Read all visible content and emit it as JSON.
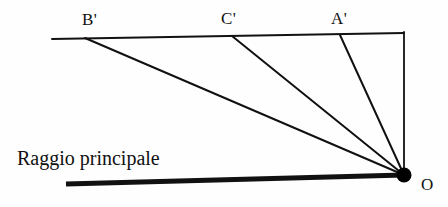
{
  "figure": {
    "background_color": "#fefefe",
    "stroke_color": "#111111",
    "width": 448,
    "height": 207,
    "caption": {
      "text": "Raggio principale"
    },
    "points": [
      {
        "id": "b-prime",
        "label": "B'",
        "x": 85,
        "y": 38
      },
      {
        "id": "c-prime",
        "label": "C'",
        "x": 232,
        "y": 36
      },
      {
        "id": "a-prime",
        "label": "A'",
        "x": 340,
        "y": 35
      },
      {
        "id": "o",
        "label": "O",
        "x": 404,
        "y": 175
      }
    ],
    "vertex": {
      "id": "o",
      "label": "O",
      "x": 404,
      "y": 175,
      "radius": 7.5,
      "fill": "#000000"
    },
    "lines": [
      {
        "id": "top-screen-line",
        "name": "image-plane-line",
        "x1": 52,
        "y1": 39,
        "x2": 404,
        "y2": 33,
        "stroke_width": 1.8
      },
      {
        "id": "right-vertical-line",
        "name": "object-vertical-line",
        "x1": 404,
        "y1": 32,
        "x2": 404,
        "y2": 175,
        "stroke_width": 1.8
      },
      {
        "id": "ray-b-prime",
        "name": "ray-to-b-prime",
        "x1": 404,
        "y1": 175,
        "x2": 85,
        "y2": 38,
        "stroke_width": 2.0
      },
      {
        "id": "ray-c-prime",
        "name": "ray-to-c-prime",
        "x1": 404,
        "y1": 175,
        "x2": 232,
        "y2": 36,
        "stroke_width": 2.0
      },
      {
        "id": "ray-a-prime",
        "name": "ray-to-a-prime",
        "x1": 404,
        "y1": 175,
        "x2": 340,
        "y2": 35,
        "stroke_width": 2.0
      },
      {
        "id": "principal-ray",
        "name": "principal-ray-thick-line",
        "x1": 66,
        "y1": 184,
        "x2": 404,
        "y2": 175,
        "stroke_width": 5.0
      }
    ]
  }
}
